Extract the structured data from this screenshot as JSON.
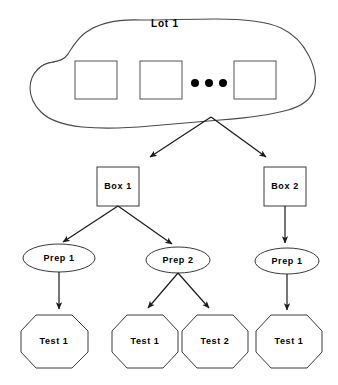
{
  "diagram": {
    "type": "hierarchy-tree",
    "title_visible": false,
    "background_color": "#ffffff",
    "line_color": "#1a1a1a",
    "shape_stroke_color": "#4a4a4a"
  },
  "lot": {
    "label": "Lot  1",
    "shape": "blob",
    "wafers": [
      {
        "label": "",
        "shape": "square"
      },
      {
        "label": "",
        "shape": "square"
      },
      {
        "label": "",
        "shape": "square"
      }
    ],
    "ellipsis": "•  •  •"
  },
  "boxes": [
    {
      "label": "Box  1",
      "shape": "rectangle"
    },
    {
      "label": "Box  2",
      "shape": "rectangle"
    }
  ],
  "preps": [
    {
      "label": "Prep  1",
      "shape": "ellipse",
      "parent": "Box  1"
    },
    {
      "label": "Prep  2",
      "shape": "ellipse",
      "parent": "Box  1"
    },
    {
      "label": "Prep  1",
      "shape": "ellipse",
      "parent": "Box  2"
    }
  ],
  "tests": [
    {
      "label": "Test  1",
      "shape": "octagon",
      "parent": "Prep  1 (Box 1)"
    },
    {
      "label": "Test  1",
      "shape": "octagon",
      "parent": "Prep  2"
    },
    {
      "label": "Test  2",
      "shape": "octagon",
      "parent": "Prep  2"
    },
    {
      "label": "Test  1",
      "shape": "octagon",
      "parent": "Prep  1 (Box 2)"
    }
  ]
}
